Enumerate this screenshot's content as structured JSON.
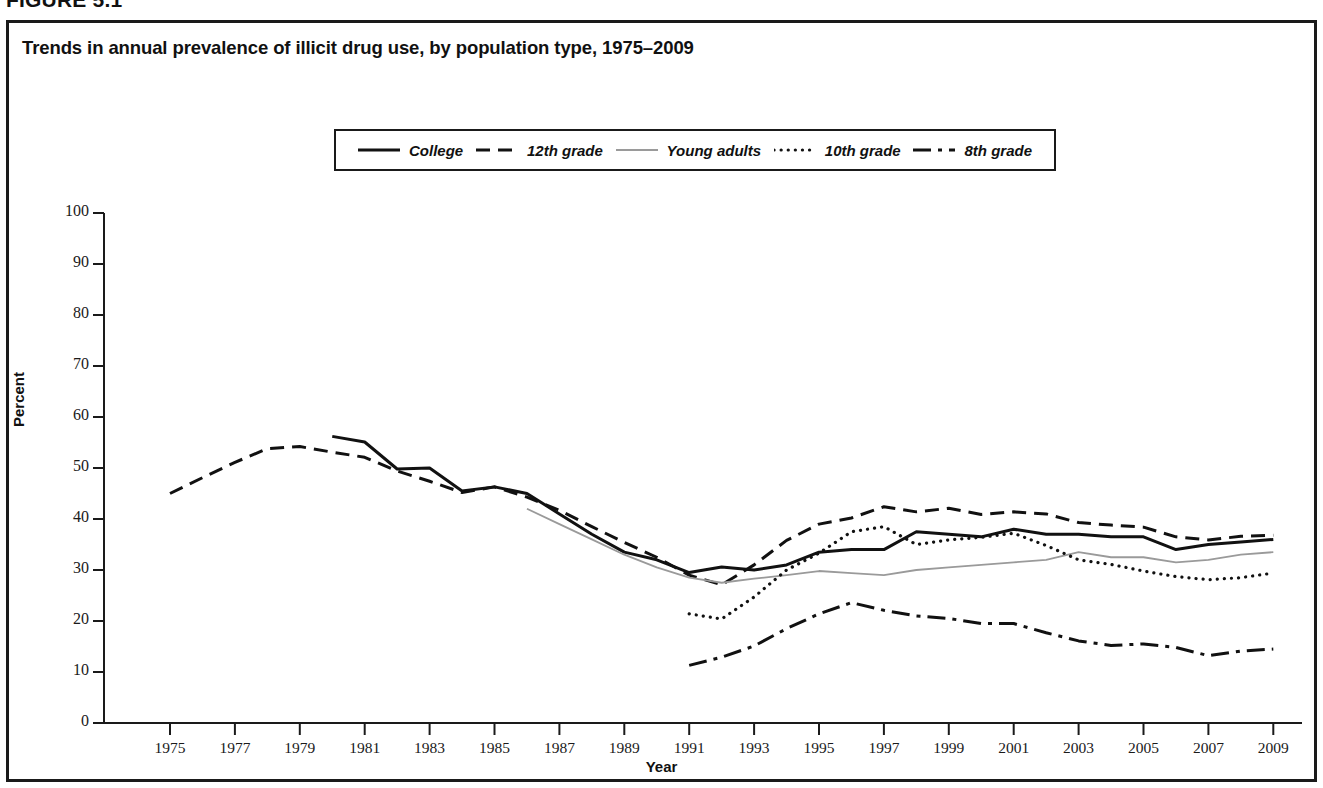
{
  "figure": {
    "number_label": "FIGURE 5.1",
    "title": "Trends in annual prevalence of illicit drug use, by population type, 1975–2009"
  },
  "axes": {
    "y_title": "Percent",
    "x_title": "Year",
    "y_ticks": [
      "0",
      "10",
      "20",
      "30",
      "40",
      "50",
      "60",
      "70",
      "80",
      "90",
      "100"
    ],
    "x_ticks": [
      "1975",
      "1977",
      "1979",
      "1981",
      "1983",
      "1985",
      "1987",
      "1989",
      "1991",
      "1993",
      "1995",
      "1997",
      "1999",
      "2001",
      "2003",
      "2005",
      "2007",
      "2009"
    ]
  },
  "legend": {
    "items": [
      {
        "label": "College",
        "style": "solid-bold",
        "color": "#111111"
      },
      {
        "label": "12th grade",
        "style": "dashed",
        "color": "#111111"
      },
      {
        "label": "Young adults",
        "style": "solid-thin",
        "color": "#9a9a9a"
      },
      {
        "label": "10th grade",
        "style": "dotted",
        "color": "#111111"
      },
      {
        "label": "8th grade",
        "style": "dash-dot",
        "color": "#111111"
      }
    ]
  },
  "chart_data": {
    "type": "line",
    "title": "Trends in annual prevalence of illicit drug use, by population type, 1975–2009",
    "xlabel": "Year",
    "ylabel": "Percent",
    "xlim": [
      1974,
      2009.5
    ],
    "ylim": [
      0,
      100
    ],
    "grid": false,
    "legend_position": "top-center",
    "x": [
      1975,
      1976,
      1977,
      1978,
      1979,
      1980,
      1981,
      1982,
      1983,
      1984,
      1985,
      1986,
      1987,
      1988,
      1989,
      1990,
      1991,
      1992,
      1993,
      1994,
      1995,
      1996,
      1997,
      1998,
      1999,
      2000,
      2001,
      2002,
      2003,
      2004,
      2005,
      2006,
      2007,
      2008,
      2009
    ],
    "series": [
      {
        "name": "College",
        "style": "solid-bold",
        "color": "#111111",
        "x": [
          1980,
          1981,
          1982,
          1983,
          1984,
          1985,
          1986,
          1987,
          1988,
          1989,
          1990,
          1991,
          1992,
          1993,
          1994,
          1995,
          1996,
          1997,
          1998,
          1999,
          2000,
          2001,
          2002,
          2003,
          2004,
          2005,
          2006,
          2007,
          2008,
          2009
        ],
        "values": [
          56.2,
          55.1,
          49.8,
          50.0,
          45.5,
          46.3,
          45.0,
          41.0,
          37.0,
          33.5,
          32.0,
          29.5,
          30.6,
          30.0,
          31.0,
          33.5,
          34.0,
          34.0,
          37.5,
          37.0,
          36.5,
          38.0,
          37.0,
          37.0,
          36.5,
          36.5,
          34.0,
          35.0,
          35.5,
          36.0
        ]
      },
      {
        "name": "12th grade",
        "style": "dashed",
        "color": "#111111",
        "x": [
          1975,
          1976,
          1977,
          1978,
          1979,
          1980,
          1981,
          1982,
          1983,
          1984,
          1985,
          1986,
          1987,
          1988,
          1989,
          1990,
          1991,
          1992,
          1993,
          1994,
          1995,
          1996,
          1997,
          1998,
          1999,
          2000,
          2001,
          2002,
          2003,
          2004,
          2005,
          2006,
          2007,
          2008,
          2009
        ],
        "values": [
          45.0,
          48.1,
          51.1,
          53.8,
          54.2,
          53.1,
          52.1,
          49.4,
          47.4,
          45.2,
          46.3,
          44.3,
          41.7,
          38.5,
          35.4,
          32.5,
          29.0,
          27.1,
          31.0,
          35.8,
          39.0,
          40.2,
          42.4,
          41.4,
          42.1,
          40.9,
          41.4,
          41.0,
          39.3,
          38.8,
          38.4,
          36.5,
          35.9,
          36.6,
          36.8
        ]
      },
      {
        "name": "Young adults",
        "style": "solid-thin",
        "color": "#9a9a9a",
        "x": [
          1986,
          1987,
          1988,
          1989,
          1990,
          1991,
          1992,
          1993,
          1994,
          1995,
          1996,
          1997,
          1998,
          1999,
          2000,
          2001,
          2002,
          2003,
          2004,
          2005,
          2006,
          2007,
          2008,
          2009
        ],
        "values": [
          42.0,
          39.0,
          36.0,
          33.0,
          30.5,
          28.5,
          27.5,
          28.3,
          29.0,
          29.8,
          29.4,
          29.0,
          30.0,
          30.5,
          31.0,
          31.5,
          32.0,
          33.5,
          32.5,
          32.5,
          31.5,
          32.0,
          33.0,
          33.5
        ]
      },
      {
        "name": "10th grade",
        "style": "dotted",
        "color": "#111111",
        "x": [
          1991,
          1992,
          1993,
          1994,
          1995,
          1996,
          1997,
          1998,
          1999,
          2000,
          2001,
          2002,
          2003,
          2004,
          2005,
          2006,
          2007,
          2008,
          2009
        ],
        "values": [
          21.4,
          20.4,
          24.7,
          30.0,
          33.3,
          37.5,
          38.5,
          35.0,
          35.9,
          36.4,
          37.2,
          34.8,
          32.0,
          31.1,
          29.8,
          28.7,
          28.1,
          28.5,
          29.4
        ]
      },
      {
        "name": "8th grade",
        "style": "dash-dot",
        "color": "#111111",
        "x": [
          1991,
          1992,
          1993,
          1994,
          1995,
          1996,
          1997,
          1998,
          1999,
          2000,
          2001,
          2002,
          2003,
          2004,
          2005,
          2006,
          2007,
          2008,
          2009
        ],
        "values": [
          11.3,
          12.9,
          15.1,
          18.5,
          21.4,
          23.6,
          22.1,
          21.0,
          20.5,
          19.5,
          19.5,
          17.7,
          16.1,
          15.2,
          15.5,
          14.8,
          13.2,
          14.1,
          14.5
        ]
      }
    ]
  }
}
